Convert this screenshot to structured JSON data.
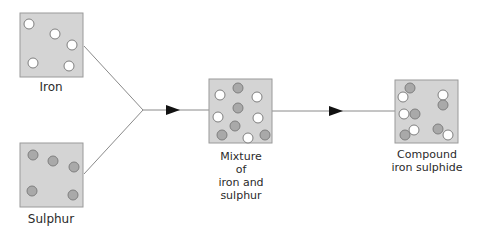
{
  "colors": {
    "box_fill": "#d4d4d4",
    "box_stroke": "#9a9a9a",
    "iron_particle": "#ffffff",
    "sulphur_particle": "#a9a9a9",
    "particle_stroke": "#7f7f7f",
    "line": "#8a8a8a",
    "arrowhead": "#111111"
  },
  "boxes": {
    "iron": {
      "label": "Iron"
    },
    "sulphur": {
      "label": "Sulphur"
    },
    "mixture": {
      "label": "Mixture\nof\niron and\nsulphur"
    },
    "compound": {
      "label": "Compound\niron sulphide"
    }
  }
}
